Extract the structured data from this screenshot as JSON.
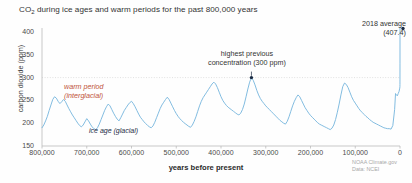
{
  "figure": {
    "title_prefix": "CO",
    "title_sub": "2",
    "title_rest": " during ice ages and warm periods for the past 800,000 years",
    "credit_line1": "NOAA Climate.gov",
    "credit_line2": "Data: NCEI"
  },
  "annotations": {
    "warm_line1": "warm period",
    "warm_line2": "(interglacial)",
    "ice_age": "ice age (glacial)",
    "highest_line1": "highest previous",
    "highest_line2": "concentration (300 ppm)",
    "avg_line1": "2018 average",
    "avg_line2": "(407.4)"
  },
  "colors": {
    "line": "#74b4dd",
    "warm_text": "#c0543c",
    "ice_text": "#1b2b44",
    "marker": "#1b2b44",
    "gridline": "#d8d8d8",
    "axis": "#bbbbbb"
  },
  "chart_data": {
    "type": "line",
    "title": "CO2 during ice ages and warm periods for the past 800,000 years",
    "xlabel": "years before present",
    "ylabel": "carbon dioxide (ppm)",
    "xlim": [
      800000,
      0
    ],
    "ylim": [
      150,
      400
    ],
    "x_ticks": [
      800000,
      700000,
      600000,
      500000,
      400000,
      300000,
      200000,
      100000,
      0
    ],
    "x_tick_labels": [
      "800,000",
      "700,000",
      "600,000",
      "500,000",
      "400,000",
      "300,000",
      "200,000",
      "100,000",
      "0"
    ],
    "y_ticks": [
      150,
      200,
      250,
      300,
      350,
      400
    ],
    "y_tick_labels": [
      "150",
      "200",
      "250",
      "300",
      "350",
      "400"
    ],
    "grid": "horizontal dotted at 300 ppm only",
    "legend": "none",
    "series": [
      {
        "name": "CO2 concentration (ice core record)",
        "units": "ppm",
        "x": [
          800000,
          796000,
          792000,
          788000,
          784000,
          780000,
          776000,
          772000,
          768000,
          764000,
          760000,
          756000,
          752000,
          748000,
          744000,
          740000,
          736000,
          732000,
          728000,
          724000,
          720000,
          716000,
          712000,
          708000,
          704000,
          700000,
          696000,
          692000,
          688000,
          684000,
          680000,
          676000,
          672000,
          668000,
          664000,
          660000,
          656000,
          652000,
          648000,
          644000,
          640000,
          636000,
          632000,
          628000,
          624000,
          620000,
          616000,
          612000,
          608000,
          604000,
          600000,
          596000,
          592000,
          588000,
          584000,
          580000,
          576000,
          572000,
          568000,
          564000,
          560000,
          556000,
          552000,
          548000,
          544000,
          540000,
          536000,
          532000,
          528000,
          524000,
          520000,
          516000,
          512000,
          508000,
          504000,
          500000,
          496000,
          492000,
          488000,
          484000,
          480000,
          476000,
          472000,
          468000,
          464000,
          460000,
          456000,
          452000,
          448000,
          444000,
          440000,
          436000,
          432000,
          428000,
          424000,
          420000,
          416000,
          412000,
          408000,
          404000,
          400000,
          396000,
          392000,
          388000,
          384000,
          380000,
          376000,
          372000,
          368000,
          364000,
          360000,
          356000,
          352000,
          348000,
          344000,
          340000,
          336000,
          332000,
          328000,
          324000,
          320000,
          316000,
          312000,
          308000,
          304000,
          300000,
          296000,
          292000,
          288000,
          284000,
          280000,
          276000,
          272000,
          268000,
          264000,
          260000,
          256000,
          252000,
          248000,
          244000,
          240000,
          236000,
          232000,
          228000,
          224000,
          220000,
          216000,
          212000,
          208000,
          204000,
          200000,
          196000,
          192000,
          188000,
          184000,
          180000,
          176000,
          172000,
          168000,
          164000,
          160000,
          156000,
          152000,
          148000,
          144000,
          140000,
          136000,
          132000,
          128000,
          124000,
          120000,
          116000,
          112000,
          108000,
          104000,
          100000,
          96000,
          92000,
          88000,
          84000,
          80000,
          76000,
          72000,
          68000,
          64000,
          60000,
          56000,
          52000,
          48000,
          44000,
          40000,
          36000,
          32000,
          28000,
          24000,
          20000,
          16000,
          12000,
          10000,
          8000,
          6000,
          4000,
          2000,
          1000,
          500,
          200,
          100,
          50,
          20,
          0
        ],
        "y": [
          190,
          196,
          205,
          215,
          228,
          240,
          252,
          258,
          255,
          248,
          243,
          247,
          252,
          248,
          240,
          232,
          225,
          218,
          212,
          206,
          200,
          195,
          192,
          196,
          203,
          210,
          205,
          198,
          192,
          188,
          186,
          190,
          198,
          208,
          218,
          228,
          236,
          242,
          238,
          230,
          222,
          215,
          209,
          205,
          212,
          220,
          228,
          234,
          240,
          245,
          248,
          243,
          236,
          228,
          220,
          213,
          208,
          203,
          199,
          195,
          192,
          190,
          194,
          202,
          212,
          222,
          232,
          240,
          246,
          252,
          257,
          252,
          244,
          236,
          228,
          221,
          215,
          210,
          206,
          202,
          199,
          196,
          193,
          191,
          196,
          204,
          214,
          226,
          238,
          248,
          256,
          262,
          268,
          274,
          280,
          286,
          290,
          286,
          278,
          268,
          258,
          250,
          244,
          239,
          235,
          232,
          229,
          226,
          223,
          220,
          218,
          222,
          230,
          242,
          258,
          275,
          290,
          300,
          294,
          284,
          272,
          262,
          254,
          248,
          243,
          238,
          234,
          230,
          226,
          222,
          218,
          214,
          210,
          206,
          203,
          200,
          198,
          204,
          214,
          226,
          238,
          248,
          256,
          262,
          258,
          250,
          242,
          234,
          228,
          222,
          217,
          213,
          209,
          205,
          201,
          198,
          196,
          194,
          192,
          190,
          188,
          186,
          189,
          196,
          208,
          224,
          242,
          262,
          280,
          288,
          285,
          278,
          268,
          258,
          250,
          244,
          238,
          232,
          227,
          223,
          219,
          215,
          212,
          208,
          205,
          202,
          200,
          198,
          196,
          194,
          192,
          190,
          189,
          188,
          188,
          187,
          195,
          230,
          265,
          262,
          260,
          265,
          270,
          275,
          277,
          280,
          285,
          295,
          330,
          407.4
        ],
        "marker_points": [
          {
            "x": 332000,
            "y": 300,
            "label": "highest previous concentration (300 ppm)"
          },
          {
            "x": 0,
            "y": 407.4,
            "label": "2018 average (407.4)"
          }
        ]
      }
    ]
  }
}
